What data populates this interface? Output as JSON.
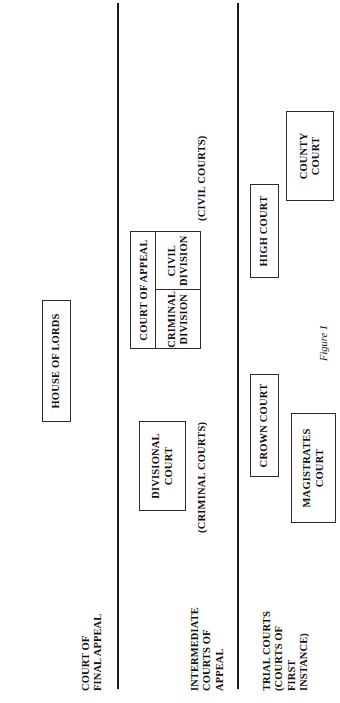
{
  "figure": {
    "caption": "Figure 1"
  },
  "tiers": [
    {
      "label": "COURT OF\nFINAL APPEAL"
    },
    {
      "label": "INTERMEDIATE\nCOURTS OF\nAPPEAL"
    },
    {
      "label": "TRIAL COURTS\n(COURTS OF\nFIRST\nINSTANCE)"
    }
  ],
  "boxes": {
    "house_of_lords": "HOUSE OF LORDS",
    "divisional_court": "DIVISIONAL\nCOURT",
    "court_of_appeal": {
      "title": "COURT OF APPEAL",
      "divisions": [
        "CRIMINAL\nDIVISION",
        "CIVIL\nDIVISION"
      ]
    },
    "high_court": "HIGH COURT",
    "crown_court": "CROWN COURT",
    "magistrates_court": "MAGISTRATES\nCOURT",
    "county_court": "COUNTY\nCOURT"
  },
  "group_captions": {
    "criminal": "(CRIMINAL COURTS)",
    "civil": "(CIVIL COURTS)"
  },
  "colors": {
    "ink": "#111111",
    "rule": "#1a1a1a",
    "box_border": "#2b2b2b",
    "background": "#ffffff"
  }
}
